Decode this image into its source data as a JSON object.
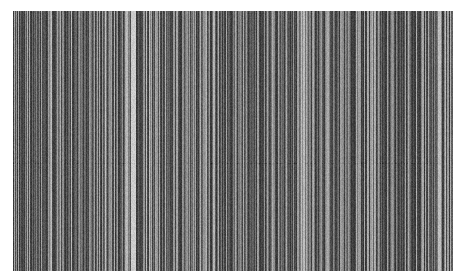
{
  "image": {
    "description": "Grayscale vertical stripe pattern on white background",
    "background": "#ffffff",
    "region": {
      "x": 13,
      "y": 11,
      "width": 440,
      "height": 260
    },
    "stripes": {
      "seed": 1337,
      "min_gray": 55,
      "max_gray": 175,
      "bright_columns": [
        {
          "x": 118,
          "width": 5,
          "gray": 205
        },
        {
          "x": 113,
          "width": 2,
          "gray": 185
        },
        {
          "x": 200,
          "width": 2,
          "gray": 180
        },
        {
          "x": 290,
          "width": 2,
          "gray": 185
        },
        {
          "x": 425,
          "width": 3,
          "gray": 190
        }
      ],
      "noise_amplitude": 12,
      "faint_horizontal_line_y": 152
    }
  }
}
